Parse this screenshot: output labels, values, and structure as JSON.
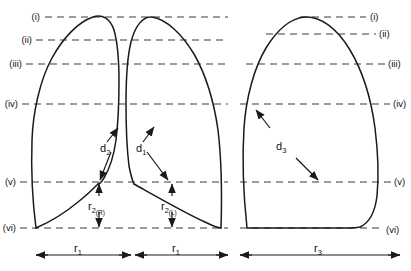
{
  "figure": {
    "background_color": "#ffffff",
    "outline_color": "#1a1a1a",
    "reference_line_color": "#3b3b3b"
  },
  "reference_levels": {
    "description": "Horizontal dashed reference lines labelled with roman numerals, shown on both the left (paired-lung) panel and the right (single-lung) panel",
    "left_panel": [
      {
        "id": "i",
        "label": "(i)",
        "y": 17
      },
      {
        "id": "ii",
        "label": "(ii)",
        "y": 40
      },
      {
        "id": "iii",
        "label": "(iii)",
        "y": 64
      },
      {
        "id": "iv",
        "label": "(iv)",
        "y": 104
      },
      {
        "id": "v",
        "label": "(v)",
        "y": 182
      },
      {
        "id": "vi",
        "label": "(vi)",
        "y": 228
      }
    ],
    "right_panel": [
      {
        "id": "i",
        "label": "(i)",
        "y": 17
      },
      {
        "id": "ii",
        "label": "(ii)",
        "y": 34
      },
      {
        "id": "iii",
        "label": "(iii)",
        "y": 64
      },
      {
        "id": "iv",
        "label": "(iv)",
        "y": 104
      },
      {
        "id": "v",
        "label": "(v)",
        "y": 182
      },
      {
        "id": "vi",
        "label": "(vi)",
        "y": 228
      }
    ]
  },
  "distance_labels": [
    {
      "id": "d2",
      "base": "d",
      "subscript": "2",
      "panel": "left",
      "note": "Right lung mediastinal distance, double-headed leader from level (iv) region to level (v)"
    },
    {
      "id": "d1",
      "base": "d",
      "subscript": "1",
      "panel": "left",
      "note": "Left lung mediastinal distance, double-headed leader from level (iv) region to level (v)"
    },
    {
      "id": "d3",
      "base": "d",
      "subscript": "3",
      "panel": "right",
      "note": "Single lung transverse distance, double-headed leader from level (iv) to level (v)"
    }
  ],
  "vertical_measures": [
    {
      "id": "r2R",
      "base": "r",
      "subscript": "2",
      "subsubscript": "(R)",
      "panel": "left",
      "note": "Vertical double-headed dimension from level (v) down to level (vi), right lung"
    },
    {
      "id": "r2L",
      "base": "r",
      "subscript": "2",
      "subsubscript": "(L)",
      "panel": "left",
      "note": "Vertical double-headed dimension from level (v) down to level (vi), left lung"
    }
  ],
  "horizontal_measures": [
    {
      "id": "r1_right",
      "base": "r",
      "subscript": "1",
      "x_start": 36,
      "x_end": 131,
      "y": 255,
      "note": "Width of right lung field at base"
    },
    {
      "id": "r1_left",
      "base": "r",
      "subscript": "1",
      "x_start": 135,
      "x_end": 228,
      "y": 255,
      "note": "Width of left lung field at base"
    },
    {
      "id": "r3",
      "base": "r",
      "subscript": "3",
      "x_start": 240,
      "x_end": 400,
      "y": 255,
      "note": "Width of the single right-hand lung panel at base"
    }
  ]
}
